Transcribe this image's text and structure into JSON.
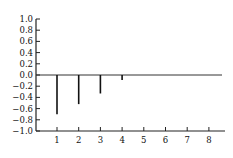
{
  "chart_data": {
    "type": "bar",
    "subtype": "stem",
    "title": "",
    "xlabel": "",
    "ylabel": "",
    "categories": [
      "1",
      "2",
      "3",
      "4",
      "5",
      "6",
      "7",
      "8"
    ],
    "x": [
      1,
      2,
      3,
      4,
      5,
      6,
      7,
      8
    ],
    "values": [
      -0.7,
      -0.52,
      -0.33,
      -0.09,
      0,
      0,
      0,
      0
    ],
    "ylim": [
      -1.0,
      1.0
    ],
    "xlim": [
      0.2,
      8.6
    ],
    "yticks": [
      "1.0",
      "0.8",
      "0.6",
      "0.4",
      "0.2",
      "0.0",
      "−0.2",
      "−0.4",
      "−0.6",
      "−0.8",
      "−1.0"
    ],
    "ytick_values": [
      1.0,
      0.8,
      0.6,
      0.4,
      0.2,
      0.0,
      -0.2,
      -0.4,
      -0.6,
      -0.8,
      -1.0
    ],
    "xticks": [
      "1",
      "2",
      "3",
      "4",
      "5",
      "6",
      "7",
      "8"
    ],
    "grid": false,
    "legend": null,
    "colors": {
      "bars": "#111111",
      "axis": "#222222",
      "zero_line": "#333333"
    }
  }
}
